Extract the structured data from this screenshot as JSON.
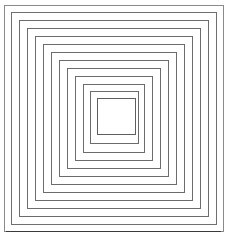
{
  "figure": {
    "type": "nested-squares-line-drawing",
    "canvas": {
      "width": 234,
      "height": 240,
      "background_color": "#ffffff"
    },
    "line_style": {
      "default_color": "#6b6b6b",
      "outer_color": "#8a8a8a",
      "bottom_accent_color": "#3a3a3a",
      "stroke_width": 1,
      "fill": "none"
    },
    "count": 13,
    "spacing_px": 8,
    "outer_square": {
      "x": 4,
      "y": 5,
      "width": 219,
      "height": 226
    },
    "inner_square": {
      "x": 97,
      "y": 98,
      "width": 38,
      "height": 36
    },
    "squares": [
      {
        "index": 1,
        "x": 4,
        "y": 5,
        "width": 219,
        "height": 226,
        "color": "#8a8a8a"
      },
      {
        "index": 2,
        "x": 11,
        "y": 12,
        "width": 205,
        "height": 212,
        "color": "#6f6f6f"
      },
      {
        "index": 3,
        "x": 19,
        "y": 20,
        "width": 189,
        "height": 196,
        "color": "#6b6b6b"
      },
      {
        "index": 4,
        "x": 27,
        "y": 28,
        "width": 173,
        "height": 180,
        "color": "#6b6b6b"
      },
      {
        "index": 5,
        "x": 35,
        "y": 36,
        "width": 157,
        "height": 164,
        "color": "#6b6b6b"
      },
      {
        "index": 6,
        "x": 43,
        "y": 44,
        "width": 141,
        "height": 148,
        "color": "#6b6b6b"
      },
      {
        "index": 7,
        "x": 51,
        "y": 52,
        "width": 125,
        "height": 132,
        "color": "#6b6b6b"
      },
      {
        "index": 8,
        "x": 59,
        "y": 60,
        "width": 109,
        "height": 116,
        "color": "#6b6b6b"
      },
      {
        "index": 9,
        "x": 67,
        "y": 68,
        "width": 93,
        "height": 100,
        "color": "#6b6b6b"
      },
      {
        "index": 10,
        "x": 75,
        "y": 76,
        "width": 77,
        "height": 84,
        "color": "#6b6b6b"
      },
      {
        "index": 11,
        "x": 83,
        "y": 84,
        "width": 61,
        "height": 68,
        "color": "#6b6b6b"
      },
      {
        "index": 12,
        "x": 90,
        "y": 91,
        "width": 48,
        "height": 52,
        "color": "#6b6b6b"
      },
      {
        "index": 13,
        "x": 97,
        "y": 98,
        "width": 38,
        "height": 36,
        "color": "#5e5e5e"
      }
    ],
    "bottom_accent": {
      "x1": 6,
      "y1": 231,
      "x2": 221,
      "y2": 231
    }
  }
}
